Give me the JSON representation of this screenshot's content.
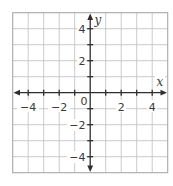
{
  "diagram": {
    "type": "coordinate-plane",
    "x_axis": {
      "label": "x",
      "min": -5,
      "max": 5,
      "tick_labels": [
        {
          "value": -4,
          "text": "−4"
        },
        {
          "value": -2,
          "text": "−2"
        },
        {
          "value": 2,
          "text": "2"
        },
        {
          "value": 4,
          "text": "4"
        }
      ]
    },
    "y_axis": {
      "label": "y",
      "min": -5,
      "max": 5,
      "tick_labels": [
        {
          "value": 4,
          "text": "4"
        },
        {
          "value": 2,
          "text": "2"
        },
        {
          "value": -2,
          "text": "−2"
        },
        {
          "value": -4,
          "text": "−4"
        }
      ]
    },
    "origin_label": "0",
    "grid": {
      "step": 1,
      "cells_x": 10,
      "cells_y": 10
    },
    "colors": {
      "grid": "#c4c4c4",
      "border": "#a8a8a8",
      "axis": "#2e2e2e",
      "text": "#3a3a3a",
      "background": "#ffffff"
    }
  }
}
